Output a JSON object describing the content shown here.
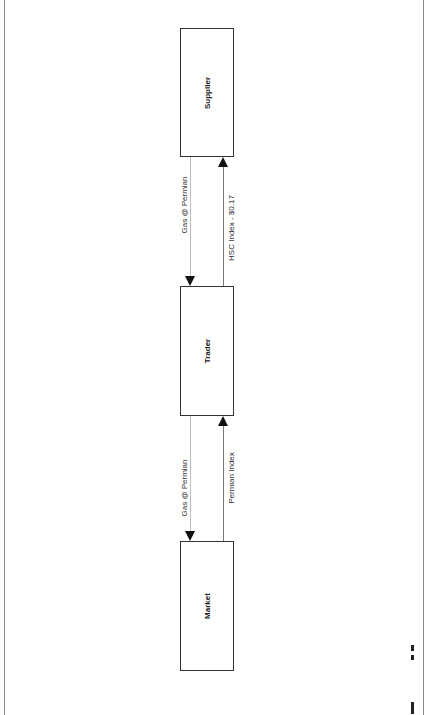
{
  "diagram": {
    "nodes": [
      {
        "id": "supplier",
        "label": "Supplier"
      },
      {
        "id": "trader",
        "label": "Trader"
      },
      {
        "id": "market",
        "label": "Market"
      }
    ],
    "edges": [
      {
        "from": "trader",
        "to": "supplier",
        "label": "Gas @ Permian",
        "direction": "supplier-to-trader",
        "type": "physical"
      },
      {
        "from": "trader",
        "to": "supplier",
        "label": "HSC Index - $0.17",
        "direction": "trader-to-supplier",
        "type": "payment"
      },
      {
        "from": "trader",
        "to": "market",
        "label": "Gas @ Permian",
        "direction": "trader-to-market",
        "type": "physical"
      },
      {
        "from": "market",
        "to": "trader",
        "label": "Permian Index",
        "direction": "market-to-trader",
        "type": "payment"
      }
    ]
  },
  "colors": {
    "box_border": "#333333",
    "flow_line": "#bdbdbd",
    "payment_line": "#7a7a7a",
    "arrowhead": "#111111"
  }
}
